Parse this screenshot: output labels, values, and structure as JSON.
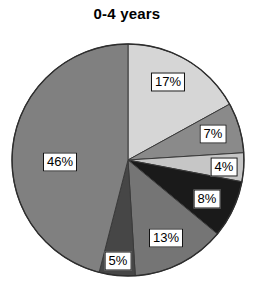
{
  "chart_data": {
    "type": "pie",
    "title": "0-4 years",
    "subtitle": "",
    "xlabel": "",
    "ylabel": "",
    "legend": "none",
    "grid": false,
    "start_angle_deg": 0,
    "direction": "clockwise",
    "units": "percent",
    "categories": [
      "17%",
      "7%",
      "4%",
      "8%",
      "13%",
      "5%",
      "46%"
    ],
    "values": [
      17,
      7,
      4,
      8,
      13,
      5,
      46
    ],
    "total": 100,
    "colors": [
      "#d6d6d6",
      "#8a8a8a",
      "#c6c6c6",
      "#1a1a1a",
      "#757575",
      "#464646",
      "#808080"
    ],
    "slices": [
      {
        "label": "17%",
        "value": 17,
        "color": "#d6d6d6",
        "label_x": 168,
        "label_y": 82
      },
      {
        "label": "7%",
        "value": 7,
        "color": "#8a8a8a",
        "label_x": 213,
        "label_y": 134
      },
      {
        "label": "4%",
        "value": 4,
        "color": "#c6c6c6",
        "label_x": 224,
        "label_y": 167
      },
      {
        "label": "8%",
        "value": 8,
        "color": "#1a1a1a",
        "label_x": 207,
        "label_y": 199
      },
      {
        "label": "13%",
        "value": 13,
        "color": "#757575",
        "label_x": 166,
        "label_y": 238
      },
      {
        "label": "5%",
        "value": 5,
        "color": "#464646",
        "label_x": 118,
        "label_y": 261
      },
      {
        "label": "46%",
        "value": 46,
        "color": "#808080",
        "label_x": 60,
        "label_y": 162
      }
    ],
    "geometry": {
      "center_x": 128,
      "center_y": 160,
      "radius": 116
    },
    "outline_color": "#2e2e2e",
    "label_box_fill": "#ffffff",
    "label_box_border": "#111111",
    "background": "#ffffff"
  }
}
